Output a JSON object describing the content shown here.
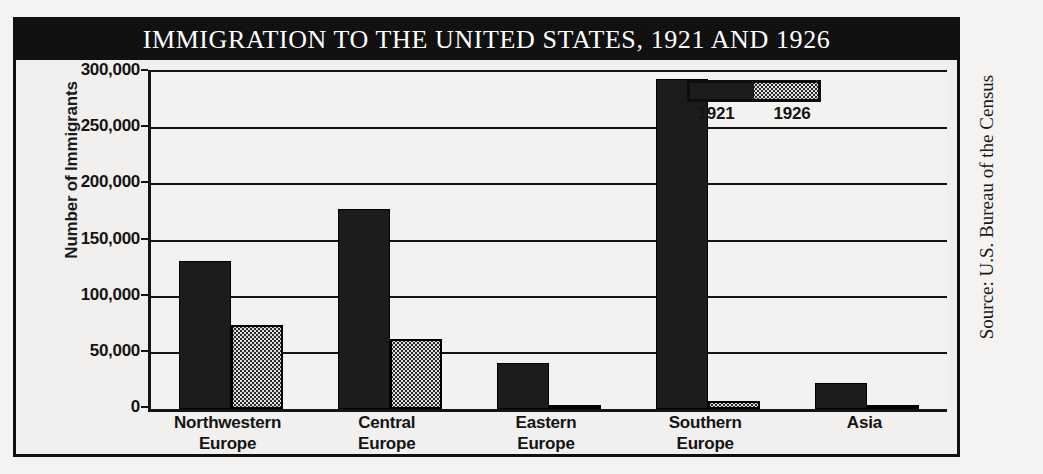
{
  "figure": {
    "title": "IMMIGRATION TO THE UNITED STATES, 1921 AND 1926",
    "source": "Source: U.S. Bureau of the Census"
  },
  "legend": {
    "series": [
      {
        "label": "1921",
        "swatch": "solid-black"
      },
      {
        "label": "1926",
        "swatch": "stippled-light"
      }
    ]
  },
  "chart_data": {
    "type": "bar",
    "title": "IMMIGRATION TO THE UNITED STATES, 1921 AND 1926",
    "xlabel": "",
    "ylabel": "Number of Immigrants",
    "ylim": [
      0,
      300000
    ],
    "ytick_labels": [
      "300,000",
      "250,000",
      "200,000",
      "150,000",
      "100,000",
      "50,000",
      "0"
    ],
    "ytick_values": [
      300000,
      250000,
      200000,
      150000,
      100000,
      50000,
      0
    ],
    "grid": true,
    "legend_position": "top-right",
    "categories": [
      "Northwestern Europe",
      "Central Europe",
      "Eastern Europe",
      "Southern Europe",
      "Asia"
    ],
    "category_lines": [
      [
        "Northwestern",
        "Europe"
      ],
      [
        "Central",
        "Europe"
      ],
      [
        "Eastern",
        "Europe"
      ],
      [
        "Southern",
        "Europe"
      ],
      [
        "Asia",
        ""
      ]
    ],
    "series": [
      {
        "name": "1921",
        "color": "#1c1c1c",
        "values": [
          132000,
          178000,
          41000,
          294000,
          23000
        ]
      },
      {
        "name": "1926",
        "color": "#dedede",
        "values": [
          75000,
          62000,
          2000,
          7000,
          1000
        ]
      }
    ]
  }
}
